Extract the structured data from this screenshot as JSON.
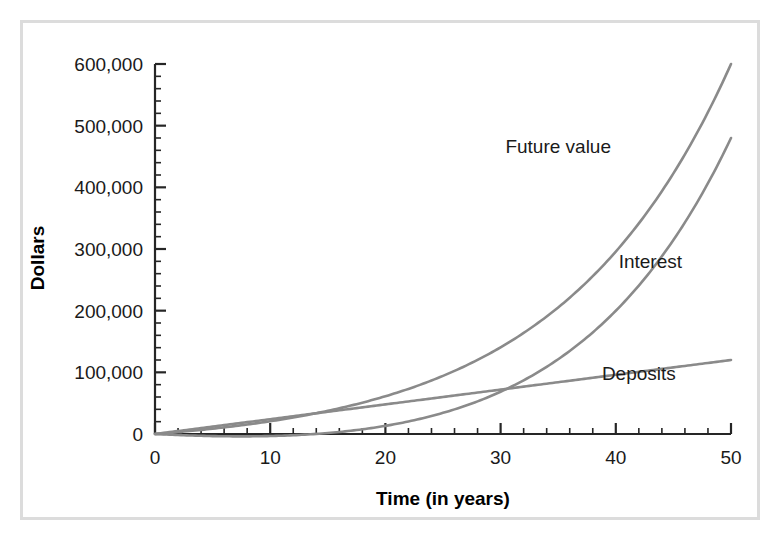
{
  "chart_data": {
    "type": "line",
    "title": "",
    "xlabel": "Time (in years)",
    "ylabel": "Dollars",
    "xlim": [
      0,
      50
    ],
    "ylim": [
      0,
      600000
    ],
    "grid": false,
    "legend_position": "inline-annotations",
    "x_ticks": [
      0,
      10,
      20,
      30,
      40,
      50
    ],
    "x_tick_labels": [
      "0",
      "10",
      "20",
      "30",
      "40",
      "50"
    ],
    "x_minor_interval": 2,
    "y_ticks": [
      0,
      100000,
      200000,
      300000,
      400000,
      500000,
      600000
    ],
    "y_tick_labels": [
      "0",
      "100,000",
      "200,000",
      "300,000",
      "400,000",
      "500,000",
      "600,000"
    ],
    "y_minor_interval": 20000,
    "series_color": "#8a8a8a",
    "x": [
      0,
      2,
      4,
      6,
      8,
      10,
      12,
      14,
      16,
      18,
      20,
      22,
      24,
      26,
      28,
      30,
      32,
      34,
      36,
      38,
      40,
      42,
      44,
      46,
      48,
      50
    ],
    "series": [
      {
        "name": "Future value",
        "label": "Future value",
        "values": [
          0,
          5100,
          11000,
          17800,
          25600,
          34600,
          44900,
          56700,
          70300,
          85900,
          103800,
          124400,
          148000,
          175100,
          206200,
          241900,
          282800,
          329800,
          383600,
          445400,
          516200,
          597400,
          690500,
          797200,
          919700,
          1060000
        ],
        "value_at_50": 600000
      },
      {
        "name": "Deposits",
        "label": "Deposits",
        "values": [
          0,
          4800,
          9600,
          14400,
          19200,
          24000,
          28800,
          33600,
          38400,
          43200,
          48000,
          52800,
          57600,
          62400,
          67200,
          72000,
          76800,
          81600,
          86400,
          91200,
          96000,
          100800,
          105600,
          110400,
          115200,
          120000
        ],
        "value_at_50": 120000
      },
      {
        "name": "Interest",
        "label": "Interest",
        "values": [
          0,
          300,
          1400,
          3400,
          6400,
          10600,
          16100,
          23100,
          31900,
          42700,
          55800,
          71600,
          90400,
          112700,
          139000,
          169900,
          206000,
          248200,
          297200,
          354200,
          420200,
          496600,
          584900,
          686800,
          804500,
          480000
        ],
        "value_at_50": 480000
      }
    ],
    "annotations": [
      {
        "text": "Future value",
        "x": 35,
        "y": 455000
      },
      {
        "text": "Interest",
        "x": 43,
        "y": 270000
      },
      {
        "text": "Deposits",
        "x": 42,
        "y": 88000
      }
    ]
  },
  "axes": {
    "y_title": "Dollars",
    "x_title": "Time (in years)"
  }
}
